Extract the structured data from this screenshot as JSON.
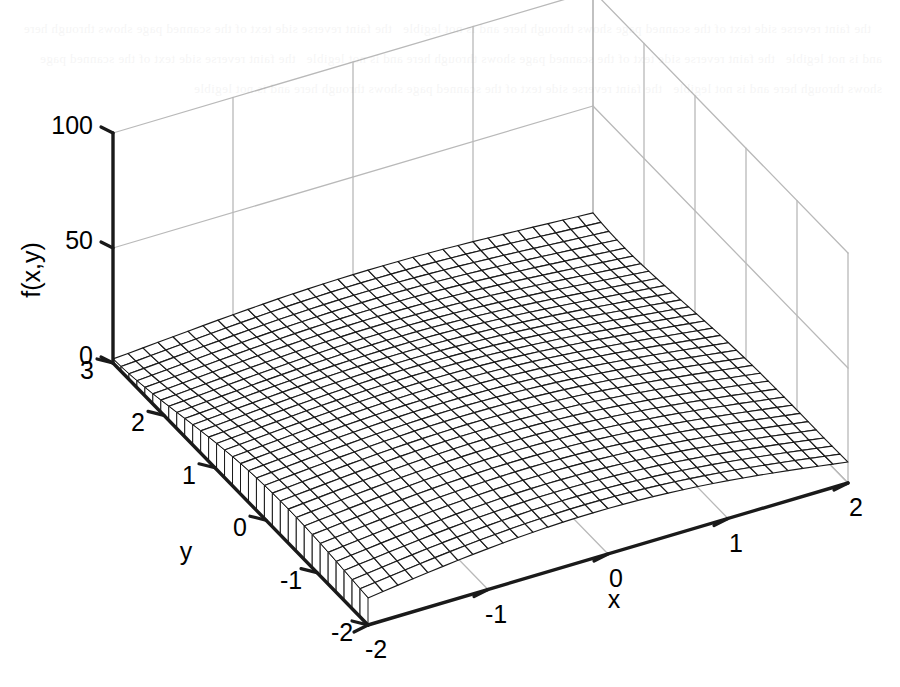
{
  "figure": {
    "kind": "3d-mesh-surface",
    "background_color": "#ffffff",
    "mesh_color": "#1a1a1a",
    "grid_color": "#b9b9b9",
    "axis_color": "#1a1a1a"
  },
  "axes": {
    "x": {
      "label": "x",
      "ticks": [
        "-2",
        "-1",
        "0",
        "1",
        "2"
      ],
      "tick_values": [
        -2,
        -1,
        0,
        1,
        2
      ],
      "range": [
        -2,
        2
      ]
    },
    "y": {
      "label": "y",
      "ticks": [
        "3",
        "2",
        "1",
        "0",
        "-1",
        "-2"
      ],
      "tick_values": [
        3,
        2,
        1,
        0,
        -1,
        -2
      ],
      "range": [
        -2,
        3
      ]
    },
    "z": {
      "label": "f(x,y)",
      "ticks": [
        "0",
        "50",
        "100"
      ],
      "tick_values": [
        0,
        50,
        100
      ],
      "range": [
        0,
        100
      ]
    }
  },
  "chart_data": {
    "type": "surface",
    "title": "",
    "xlabel": "x",
    "ylabel": "y",
    "zlabel": "f(x,y)",
    "xlim": [
      -2,
      2
    ],
    "ylim": [
      -2,
      3
    ],
    "zlim": [
      0,
      100
    ],
    "grid": true,
    "legend": "none",
    "mesh_rows": 33,
    "mesh_cols": 33,
    "view_azimuth_deg": -37.5,
    "view_elevation_deg": 30,
    "function": "f(x,y) = (x^2 + y - 11)^2/9 + (x + y^2 - 7)^2/9",
    "z_samples": {
      "x_values": [
        -2,
        -1,
        0,
        1,
        2
      ],
      "y_values": [
        -2,
        -1,
        0,
        1,
        2,
        3
      ],
      "z_rows": [
        [
          26.0,
          15.0,
          11.1,
          14.2,
          24.4
        ],
        [
          34.2,
          20.6,
          14.0,
          14.2,
          21.4
        ],
        [
          37.3,
          22.2,
          13.4,
          11.6,
          16.9
        ],
        [
          40.4,
          24.9,
          15.8,
          13.3,
          17.8
        ],
        [
          58.0,
          42.2,
          33.3,
          31.6,
          36.9
        ],
        [
          100.0,
          85.0,
          75.6,
          73.8,
          79.1
        ]
      ]
    },
    "annotations": []
  }
}
